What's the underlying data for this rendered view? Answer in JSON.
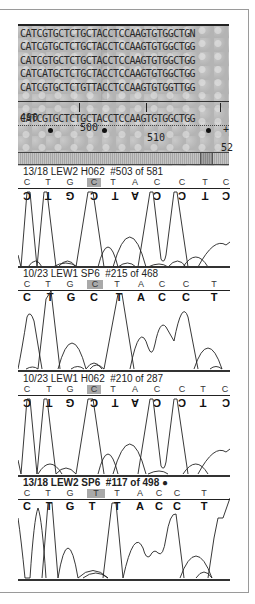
{
  "alignment": {
    "sequences": [
      "CATCGTGCTCTGCTACCTCCAAGTGTGGCTGN",
      "CATCGTGCTCTGCTACCTCCAAGTGTGGCTGG",
      "CATCGTGCTCTGCTACCTCCAAGTGTGGCTGG",
      "CATCATGCTCTGCTACCTCCAAGTGTGGCTGG",
      "CATCGTGCTCTGTTACCTCCAAGTGTGGTTGG"
    ],
    "ruler": [
      {
        "label": "490",
        "x": 0
      },
      {
        "label": "500",
        "x": 58
      },
      {
        "label": "510",
        "x": 125
      },
      {
        "label": "52",
        "x": 199
      }
    ],
    "consensus": "CATCGTGCTCTGCTACCTCCAAGTGTGGCTGG",
    "markers": [
      {
        "x": 28
      },
      {
        "x": 82
      },
      {
        "x": 186
      }
    ],
    "plus_marker": "+"
  },
  "traces": [
    {
      "label": "13/18 LEW2 H062  #503 of 581",
      "bold": false,
      "bases": [
        "C",
        "T",
        "G",
        "C",
        "T",
        "A",
        "C",
        "C",
        "T",
        "C"
      ],
      "called": [
        "C",
        "T",
        "G",
        "C",
        "T",
        "A",
        "C",
        "C",
        "T",
        "C"
      ],
      "called_flipped": true,
      "highlight_index": 3
    },
    {
      "label": "10/23 LEW1 SP6  #215 of 468",
      "bold": false,
      "bases": [
        "C",
        "T",
        "G",
        "C",
        "T",
        "A",
        "C",
        "C",
        "T"
      ],
      "called": [
        "C",
        "T",
        "G",
        "C",
        "T",
        "A",
        "C",
        "C",
        "T"
      ],
      "called_flipped": false,
      "highlight_index": 3
    },
    {
      "label": "10/23 LEW1 H062  #210 of 287",
      "bold": false,
      "bases": [
        "C",
        "T",
        "G",
        "C",
        "T",
        "A",
        "C",
        "C",
        "T",
        "C"
      ],
      "called": [
        "C",
        "T",
        "G",
        "C",
        "T",
        "A",
        "C",
        "C",
        "T",
        "C"
      ],
      "called_flipped": true,
      "highlight_index": 3
    },
    {
      "label": "13/18 LEW2 SP6  #117 of 498 ●",
      "bold": true,
      "bases": [
        "C",
        "T",
        "G",
        "T",
        "T",
        "A",
        "C",
        "C",
        "T"
      ],
      "called": [
        "C",
        "T",
        "G",
        "T",
        "T",
        "A",
        "C",
        "C",
        "T"
      ],
      "called_flipped": false,
      "highlight_index": 3
    }
  ]
}
